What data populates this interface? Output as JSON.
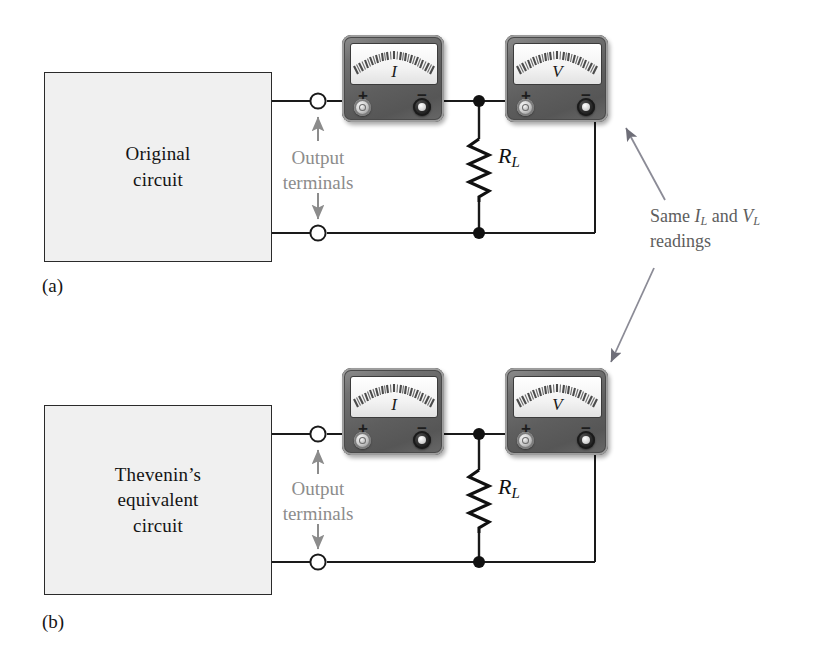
{
  "figure": {
    "background_color": "#ffffff",
    "wire_color": "#1a1a1a",
    "gray_text_color": "#8c8c8c",
    "note_text_color": "#5d5d5d",
    "box_fill_color": "#f0f0f0"
  },
  "panel_a": {
    "part_label": "(a)",
    "box_label_line1": "Original",
    "box_label_line2": "circuit",
    "terminals_label_line1": "Output",
    "terminals_label_line2": "terminals",
    "resistor_label": "R",
    "resistor_sub": "L",
    "ammeter": {
      "face_label": "I",
      "plus_sign": "+",
      "minus_sign": "−",
      "plus_jack": "light-jack-icon",
      "minus_jack": "dark-jack-icon"
    },
    "voltmeter": {
      "face_label": "V",
      "plus_sign": "+",
      "minus_sign": "−",
      "plus_jack": "light-jack-icon",
      "minus_jack": "dark-jack-icon"
    }
  },
  "panel_b": {
    "part_label": "(b)",
    "box_label_line1": "Thevenin’s",
    "box_label_line2": "equivalent",
    "box_label_line3": "circuit",
    "terminals_label_line1": "Output",
    "terminals_label_line2": "terminals",
    "resistor_label": "R",
    "resistor_sub": "L",
    "ammeter": {
      "face_label": "I",
      "plus_sign": "+",
      "minus_sign": "−",
      "plus_jack": "light-jack-icon",
      "minus_jack": "dark-jack-icon"
    },
    "voltmeter": {
      "face_label": "V",
      "plus_sign": "+",
      "minus_sign": "−",
      "plus_jack": "light-jack-icon",
      "minus_jack": "dark-jack-icon"
    }
  },
  "annotation": {
    "line1_prefix": "Same ",
    "line1_sym1": "I",
    "line1_sym1_sub": "L",
    "line1_mid": " and ",
    "line1_sym2": "V",
    "line1_sym2_sub": "L",
    "line2": "readings",
    "arrow_up_name": "arrow-to-panel-a",
    "arrow_down_name": "arrow-to-panel-b"
  }
}
